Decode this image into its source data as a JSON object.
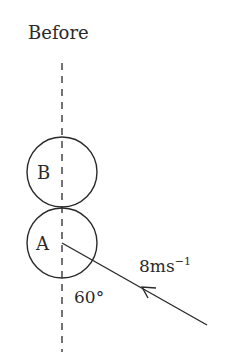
{
  "title": "Before",
  "balls": [
    {
      "label": "B"
    },
    {
      "label": "A"
    }
  ],
  "velocity": {
    "value": "8ms",
    "exponent": "−1"
  },
  "angle": "60°",
  "colors": {
    "ink": "#2a2a2a",
    "background": "#ffffff"
  }
}
